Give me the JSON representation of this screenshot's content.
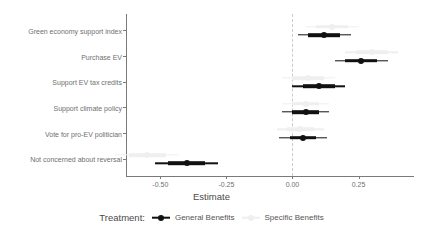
{
  "chart_data": {
    "type": "scatter",
    "title": "",
    "xlabel": "Estimate",
    "ylabel": "",
    "xlim": [
      -0.63,
      0.46
    ],
    "xticks": [
      -0.5,
      -0.25,
      0.0,
      0.25
    ],
    "xtick_labels": [
      "-0.50",
      "-0.25",
      "0.00",
      "0.25"
    ],
    "grid": false,
    "zero_reference_line": 0.0,
    "legend_position": "bottom",
    "legend_title": "Treatment:",
    "categories": [
      "Green economy support index",
      "Purchase EV",
      "Support EV tax credits",
      "Support climate policy",
      "Vote for pro-EV politician",
      "Not concerned about reversal"
    ],
    "series": [
      {
        "name": "General Benefits",
        "color": "#111111",
        "values": [
          0.12,
          0.26,
          0.1,
          0.05,
          0.04,
          -0.4
        ],
        "inner_low": [
          0.06,
          0.2,
          0.04,
          0.0,
          -0.01,
          -0.47
        ],
        "inner_high": [
          0.18,
          0.32,
          0.16,
          0.1,
          0.09,
          -0.33
        ],
        "outer_low": [
          0.02,
          0.16,
          0.0,
          -0.04,
          -0.05,
          -0.52
        ],
        "outer_high": [
          0.22,
          0.36,
          0.2,
          0.14,
          0.13,
          -0.28
        ]
      },
      {
        "name": "Specific Benefits",
        "color": "#efefef",
        "values": [
          0.15,
          0.3,
          0.06,
          0.05,
          0.03,
          -0.55
        ],
        "inner_low": [
          0.09,
          0.24,
          0.0,
          0.0,
          -0.02,
          -0.62
        ],
        "inner_high": [
          0.21,
          0.36,
          0.12,
          0.1,
          0.08,
          -0.48
        ],
        "outer_low": [
          0.05,
          0.2,
          -0.04,
          -0.04,
          -0.06,
          -0.67
        ],
        "outer_high": [
          0.25,
          0.4,
          0.16,
          0.14,
          0.12,
          -0.43
        ]
      }
    ]
  }
}
